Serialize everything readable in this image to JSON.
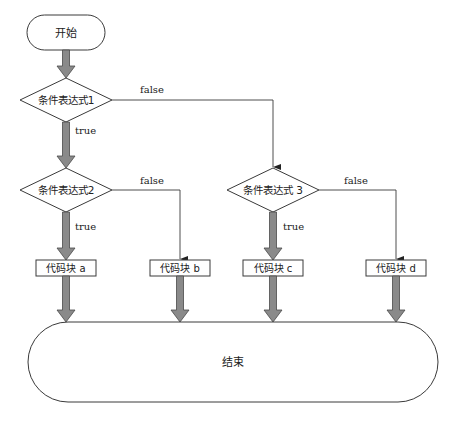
{
  "diagram": {
    "type": "flowchart",
    "colors": {
      "stroke": "#3a3a3a",
      "arrow_fill": "#8a8a8a",
      "arrow_stroke": "#4a4a4a",
      "background": "#ffffff"
    },
    "nodes": {
      "start": {
        "label": "开始",
        "shape": "terminal"
      },
      "cond1": {
        "label": "条件表达式1",
        "shape": "decision"
      },
      "cond2": {
        "label": "条件表达式2",
        "shape": "decision"
      },
      "cond3": {
        "label": "条件表达式 3",
        "shape": "decision"
      },
      "block_a": {
        "label": "代码块 a",
        "shape": "process"
      },
      "block_b": {
        "label": "代码块 b",
        "shape": "process"
      },
      "block_c": {
        "label": "代码块 c",
        "shape": "process"
      },
      "block_d": {
        "label": "代码块 d",
        "shape": "process"
      },
      "end": {
        "label": "结束",
        "shape": "terminal"
      }
    },
    "edges": {
      "cond1_true": {
        "from": "cond1",
        "to": "cond2",
        "label": "true"
      },
      "cond1_false": {
        "from": "cond1",
        "to": "cond3",
        "label": "false"
      },
      "cond2_true": {
        "from": "cond2",
        "to": "block_a",
        "label": "true"
      },
      "cond2_false": {
        "from": "cond2",
        "to": "block_b",
        "label": "false"
      },
      "cond3_true": {
        "from": "cond3",
        "to": "block_c",
        "label": "true"
      },
      "cond3_false": {
        "from": "cond3",
        "to": "block_d",
        "label": "false"
      }
    }
  }
}
